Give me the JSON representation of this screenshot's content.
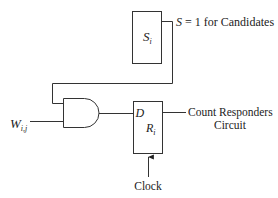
{
  "diagram": {
    "select_register": {
      "label": "S",
      "subscript": "i",
      "output_annotation": "S = 1 for Candidates",
      "output_annotation_var": "S",
      "output_annotation_rest": " = 1 for Candidates"
    },
    "input": {
      "label": "W",
      "subscript": "i,j"
    },
    "gate": {
      "type": "AND"
    },
    "result_register": {
      "label": "R",
      "subscript": "i",
      "input_pin": "D"
    },
    "output": {
      "line1": "Count Responders",
      "line2": "Circuit"
    },
    "clock": {
      "label": "Clock"
    }
  }
}
